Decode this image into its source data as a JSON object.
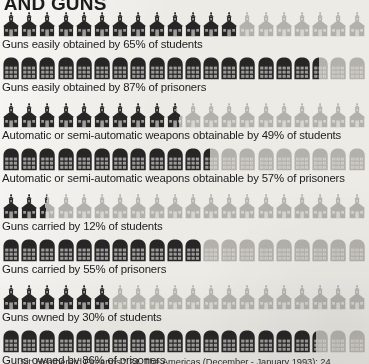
{
  "title": "S AND GUNS",
  "source": "Sit: Heatherard Firearms.\" 24. The Americas (December - January 1993): 24.",
  "palette": {
    "background": "#edebe6",
    "icon_filled": "#262626",
    "icon_empty": "#b3b1ac",
    "text": "#1c1c1c"
  },
  "chart_data": {
    "type": "bar",
    "title": "S AND GUNS",
    "xlabel": "",
    "ylabel": "",
    "units": "percent",
    "icon_total_per_row": 20,
    "icon_value_each": 5,
    "legend": [
      {
        "key": "students",
        "icon": "schoolhouse-icon",
        "label": "students"
      },
      {
        "key": "prisoners",
        "icon": "prison-icon",
        "label": "prisoners"
      }
    ],
    "categories": [
      "Guns easily obtained by 65% of students",
      "Guns easily obtained by 87% of prisoners",
      "Automatic or semi-automatic weapons obtainable by 49% of students",
      "Automatic or semi-automatic weapons obtainable by 57% of prisoners",
      "Guns carried by 12% of students",
      "Guns carried by 55% of prisoners",
      "Guns owned by 30% of students",
      "Guns owned by 86% of prisoners"
    ],
    "values": [
      65,
      87,
      49,
      57,
      12,
      55,
      30,
      86
    ],
    "ylim": [
      0,
      100
    ]
  },
  "rows": [
    {
      "label": "Guns easily obtained by 65% of students",
      "group": "students",
      "icon": "schoolhouse-icon",
      "percent": 65,
      "filled_icons": 13,
      "total_icons": 20
    },
    {
      "label": "Guns easily obtained by 87% of prisoners",
      "group": "prisoners",
      "icon": "prison-icon",
      "percent": 87,
      "filled_icons": 17.4,
      "total_icons": 20
    },
    {
      "label": "Automatic or semi-automatic weapons obtainable by 49% of students",
      "group": "students",
      "icon": "schoolhouse-icon",
      "percent": 49,
      "filled_icons": 9.8,
      "total_icons": 20
    },
    {
      "label": "Automatic or semi-automatic weapons obtainable by 57% of prisoners",
      "group": "prisoners",
      "icon": "prison-icon",
      "percent": 57,
      "filled_icons": 11.4,
      "total_icons": 20
    },
    {
      "label": "Guns carried by 12% of students",
      "group": "students",
      "icon": "schoolhouse-icon",
      "percent": 12,
      "filled_icons": 2.4,
      "total_icons": 20
    },
    {
      "label": "Guns carried by 55% of prisoners",
      "group": "prisoners",
      "icon": "prison-icon",
      "percent": 55,
      "filled_icons": 11,
      "total_icons": 20
    },
    {
      "label": "Guns owned by 30% of students",
      "group": "students",
      "icon": "schoolhouse-icon",
      "percent": 30,
      "filled_icons": 6,
      "total_icons": 20
    },
    {
      "label": "Guns owned by 86% of prisoners",
      "group": "prisoners",
      "icon": "prison-icon",
      "percent": 86,
      "filled_icons": 17.2,
      "total_icons": 20
    }
  ]
}
